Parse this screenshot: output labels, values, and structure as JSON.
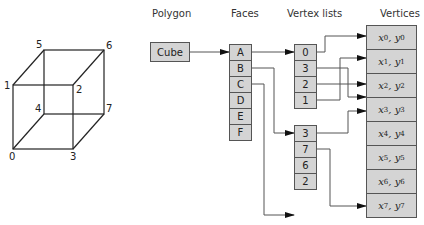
{
  "headers": {
    "polygon": "Polygon",
    "faces": "Faces",
    "vertex_lists": "Vertex lists",
    "vertices": "Vertices"
  },
  "polygon": {
    "label": "Cube"
  },
  "faces": [
    "A",
    "B",
    "C",
    "D",
    "E",
    "F"
  ],
  "vertex_lists": [
    {
      "face": "A",
      "items": [
        "0",
        "3",
        "2",
        "1"
      ]
    },
    {
      "face": "B",
      "items": [
        "3",
        "7",
        "6",
        "2"
      ]
    }
  ],
  "vertices": [
    {
      "x": "x",
      "y": "y",
      "i": "0"
    },
    {
      "x": "x",
      "y": "y",
      "i": "1"
    },
    {
      "x": "x",
      "y": "y",
      "i": "2"
    },
    {
      "x": "x",
      "y": "y",
      "i": "3"
    },
    {
      "x": "x",
      "y": "y",
      "i": "4"
    },
    {
      "x": "x",
      "y": "y",
      "i": "5"
    },
    {
      "x": "x",
      "y": "y",
      "i": "6"
    },
    {
      "x": "x",
      "y": "y",
      "i": "7"
    }
  ],
  "cube_labels": {
    "v0": "0",
    "v1": "1",
    "v2": "2",
    "v3": "3",
    "v4": "4",
    "v5": "5",
    "v6": "6",
    "v7": "7"
  },
  "colors": {
    "box_fill": "#d4d4d4",
    "line": "#555555"
  }
}
